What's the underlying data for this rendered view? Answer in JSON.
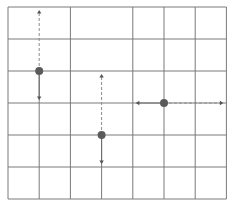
{
  "diagram": {
    "type": "grid-with-vectors",
    "grid": {
      "columns": 7,
      "rows": 6,
      "line_color": "#7a7a7a",
      "missing_vertical_segments": [
        {
          "col_line": 1,
          "from_row_line": 0,
          "to_row_line": 2
        },
        {
          "col_line": 3,
          "from_row_line": 0,
          "to_row_line": 4
        }
      ]
    },
    "points": [
      {
        "id": "point-a",
        "col": 1,
        "row": 2,
        "color": "#5a5a5a",
        "arrows": [
          {
            "direction": "up",
            "style": "dashed",
            "length_cells": 2
          },
          {
            "direction": "down",
            "style": "solid",
            "length_cells": 1
          }
        ]
      },
      {
        "id": "point-b",
        "col": 3,
        "row": 4,
        "color": "#5a5a5a",
        "arrows": [
          {
            "direction": "up",
            "style": "dashed",
            "length_cells": 2
          },
          {
            "direction": "down",
            "style": "solid",
            "length_cells": 1
          }
        ]
      },
      {
        "id": "point-c",
        "col": 5,
        "row": 3,
        "color": "#5a5a5a",
        "arrows": [
          {
            "direction": "left",
            "style": "solid",
            "length_cells": 1
          },
          {
            "direction": "right",
            "style": "dashed",
            "length_cells": 2
          }
        ]
      }
    ]
  }
}
